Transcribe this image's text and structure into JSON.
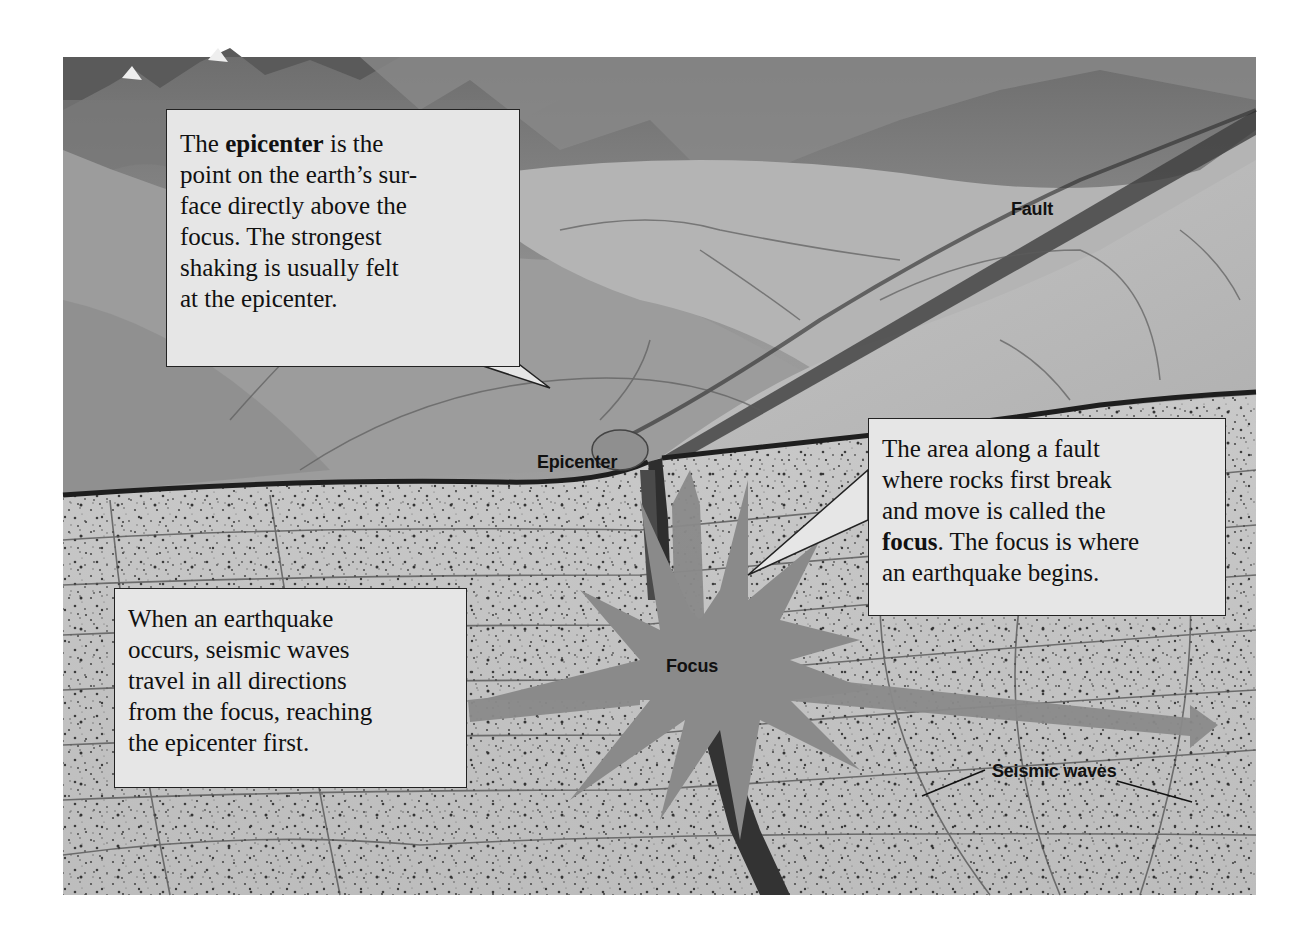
{
  "diagram": {
    "colors": {
      "background": "#ffffff",
      "callout_fill": "#e6e6e6",
      "callout_border": "#222222",
      "burst_fill": "#8a8a8a",
      "label_text": "#111111"
    },
    "labels": {
      "fault": "Fault",
      "epicenter": "Epicenter",
      "focus": "Focus",
      "seismic_waves": "Seismic waves"
    },
    "callouts": {
      "epicenter": {
        "pre": "The ",
        "bold": "epicenter",
        "post": " is the",
        "lines": [
          "point on the earth’s sur-",
          "face directly above the",
          "focus. The strongest",
          "shaking is usually felt",
          "at the epicenter."
        ]
      },
      "focus": {
        "lines": [
          "The area along a fault",
          "where rocks first break",
          "and move is called the"
        ],
        "bold": "focus",
        "post": ". The focus is where",
        "last": "an earthquake begins."
      },
      "waves": {
        "lines": [
          "When an earthquake",
          "occurs, seismic waves",
          "travel in all directions",
          "from the focus, reaching",
          "the epicenter first."
        ]
      }
    }
  }
}
